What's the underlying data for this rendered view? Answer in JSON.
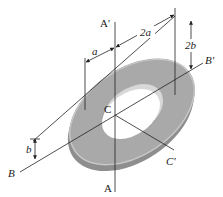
{
  "figure": {
    "type": "engineering-diagram",
    "colors": {
      "background": "#ffffff",
      "plate_face": "#a9a9a9",
      "plate_edge": "#8e8e8e",
      "plate_highlight": "#c9c9c9",
      "lines": "#222222"
    },
    "axes": [
      {
        "id": "AA",
        "start_label": "A",
        "end_label": "A'"
      },
      {
        "id": "BB",
        "start_label": "B",
        "end_label": "B'"
      },
      {
        "id": "CC",
        "start_label": "C",
        "end_label": "C'"
      }
    ],
    "center_label": "C",
    "dimensions": [
      {
        "id": "dim-a",
        "label": "a"
      },
      {
        "id": "dim-2a",
        "label": "2a"
      },
      {
        "id": "dim-b",
        "label": "b"
      },
      {
        "id": "dim-2b",
        "label": "2b"
      }
    ]
  }
}
